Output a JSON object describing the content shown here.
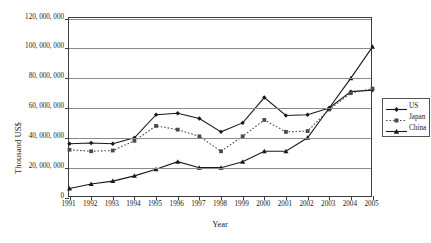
{
  "chart_data": {
    "type": "line",
    "title": "",
    "xlabel": "Year",
    "ylabel": "Thousand US$",
    "grid": true,
    "legend_position": "right",
    "xlim": [
      1991,
      2005
    ],
    "ylim": [
      0,
      120000000
    ],
    "ytick_step": 20000000,
    "ytick_labels": [
      "120, 000, 000",
      "100, 000, 000",
      "80, 000, 000",
      "60, 000, 000",
      "40, 000, 000",
      "20, 000, 000",
      "0"
    ],
    "ytick_values": [
      120000000,
      100000000,
      80000000,
      60000000,
      40000000,
      20000000,
      0
    ],
    "categories": [
      "1991",
      "1992",
      "1993",
      "1994",
      "1995",
      "1996",
      "1997",
      "1998",
      "1999",
      "2000",
      "2001",
      "2002",
      "2003",
      "2004",
      "2005"
    ],
    "x": [
      1991,
      1992,
      1993,
      1994,
      1995,
      1996,
      1997,
      1998,
      1999,
      2000,
      2001,
      2002,
      2003,
      2004,
      2005
    ],
    "series": [
      {
        "name": "US",
        "marker": "diamond",
        "linestyle": "solid",
        "color": "#1a1a1a",
        "values": [
          36000000,
          36500000,
          36000000,
          40000000,
          55500000,
          56500000,
          53000000,
          44000000,
          50000000,
          67000000,
          55000000,
          55500000,
          60000000,
          71000000,
          72000000
        ]
      },
      {
        "name": "Japan",
        "marker": "square",
        "linestyle": "dotted",
        "color": "#4a4a4a",
        "values": [
          32000000,
          31000000,
          31500000,
          38000000,
          48000000,
          45500000,
          41000000,
          31000000,
          41000000,
          52000000,
          44000000,
          44500000,
          59000000,
          70000000,
          73000000
        ]
      },
      {
        "name": "China",
        "marker": "triangle",
        "linestyle": "solid",
        "color": "#1a1a1a",
        "values": [
          6000000,
          9000000,
          11000000,
          14500000,
          19000000,
          24000000,
          20000000,
          20000000,
          24000000,
          31000000,
          31000000,
          40000000,
          60000000,
          80000000,
          101000000
        ]
      }
    ],
    "legend_entries": [
      "US",
      "Japan",
      "China"
    ]
  }
}
